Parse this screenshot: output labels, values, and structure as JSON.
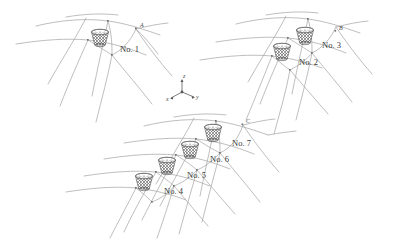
{
  "figure": {
    "background_color": "#ffffff",
    "line_color": "#a8a8a8",
    "node_color": "#6e6e6e",
    "mesh_color": "#555555",
    "label_color": "#3a3a3a"
  },
  "groups": [
    {
      "id": "group-top-left",
      "baskets": [
        {
          "label": "No. 1",
          "cx": 100,
          "cy": 38,
          "label_x": 120,
          "label_y": 52
        }
      ],
      "points": [
        {
          "name": "A",
          "x": 137,
          "y": 28,
          "label_dx": 3,
          "label_dy": -1.5
        }
      ]
    },
    {
      "id": "group-top-right",
      "baskets": [
        {
          "label": "No. 3",
          "cx": 305,
          "cy": 36,
          "label_x": 322,
          "label_y": 48
        },
        {
          "label": "No. 2",
          "cx": 282,
          "cy": 52,
          "label_x": 299,
          "label_y": 65
        }
      ],
      "points": [
        {
          "name": "B",
          "x": 336,
          "y": 31,
          "label_dx": 3,
          "label_dy": -1.5
        }
      ]
    },
    {
      "id": "group-bottom",
      "baskets": [
        {
          "label": "No. 7",
          "cx": 213,
          "cy": 133,
          "label_x": 232,
          "label_y": 146
        },
        {
          "label": "No. 6",
          "cx": 190,
          "cy": 150,
          "label_x": 210,
          "label_y": 162
        },
        {
          "label": "No. 5",
          "cx": 167,
          "cy": 166,
          "label_x": 187,
          "label_y": 178
        },
        {
          "label": "No. 4",
          "cx": 144,
          "cy": 182,
          "label_x": 164,
          "label_y": 194
        }
      ],
      "points": [
        {
          "name": "C",
          "x": 243,
          "y": 124,
          "label_dx": 3,
          "label_dy": -1.5
        }
      ]
    }
  ],
  "axes": {
    "origin_x": 182,
    "origin_y": 92,
    "labels": {
      "x": "x",
      "y": "y",
      "z": "z"
    },
    "x_label_pos": {
      "x": 168,
      "y": 101
    },
    "y_label_pos": {
      "x": 196,
      "y": 99
    },
    "z_label_pos": {
      "x": 183,
      "y": 78
    }
  }
}
